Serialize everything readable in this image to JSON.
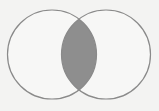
{
  "diagram": {
    "type": "venn",
    "sets": [
      {
        "name": "A",
        "cx": 52,
        "cy": 54.5,
        "r": 44.5,
        "filled": false
      },
      {
        "name": "B",
        "cx": 106,
        "cy": 54.5,
        "r": 44.5,
        "filled": false
      }
    ],
    "shaded_region": "intersection",
    "colors": {
      "background": "#f3f3f2",
      "stroke": "#8a8a8a",
      "shade": "#8e8e8e",
      "circle_fill": "#f7f7f6"
    }
  }
}
